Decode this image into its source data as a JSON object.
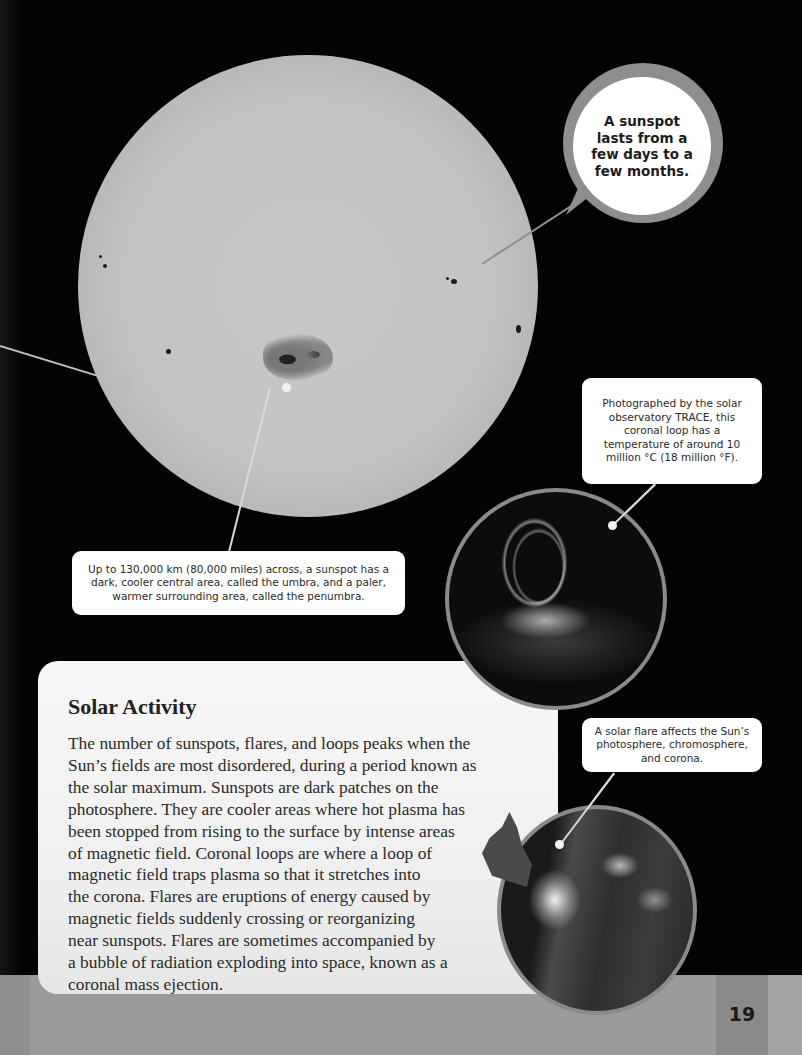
{
  "page": {
    "number": "19",
    "colors": {
      "background": "#030303",
      "panel": "#f2f2f2",
      "band": "#9b9b9b",
      "bubble_ring": "#8e8e8e",
      "photo_border": "#8a8a8a"
    }
  },
  "images": {
    "sun": "sun-photosphere-with-sunspots",
    "coronal_loop": "trace-coronal-loop-photo",
    "solar_flare": "solar-flare-photo"
  },
  "callouts": {
    "bubble": "A sunspot lasts from a few days to a few months.",
    "sunspot_caption": "Up to 130,000 km (80,000 miles) across, a sunspot has a dark, cooler central area, called the umbra, and a paler, warmer surrounding area, called the penumbra.",
    "trace_caption": "Photographed by the solar observatory TRACE, this coronal loop has a temperature of around 10 million °C (18 million °F).",
    "flare_caption": "A solar flare affects the Sun’s photosphere, chromosphere, and corona."
  },
  "article": {
    "title": "Solar Activity",
    "body_lines": [
      "The number of sunspots, flares, and loops peaks when the",
      "Sun’s fields are most disordered, during a period known as",
      "the solar maximum. Sunspots are dark patches on the",
      "photosphere. They are cooler areas where hot plasma has",
      "been stopped from rising to the surface by intense areas",
      "of magnetic field. Coronal loops are where a loop of",
      "magnetic field traps plasma so that it stretches into",
      "the corona. Flares are eruptions of energy caused by",
      "magnetic fields suddenly crossing or reorganizing",
      "near sunspots. Flares are sometimes accompanied by",
      "a bubble of radiation exploding into space, known as a",
      "coronal mass ejection."
    ]
  }
}
